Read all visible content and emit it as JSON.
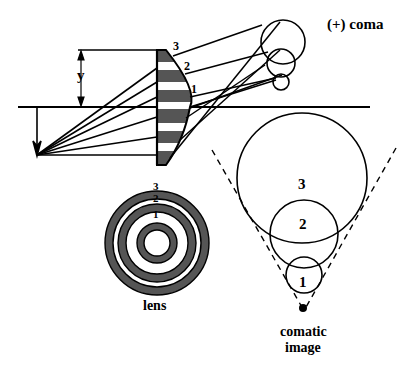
{
  "title": "(+) coma",
  "labels": {
    "height": "y",
    "zone1": "1",
    "zone2": "2",
    "zone3": "3",
    "lens": "lens",
    "comatic_line1": "comatic",
    "comatic_line2": "image"
  },
  "rings": {
    "lens_zones": [
      "1",
      "2",
      "3"
    ],
    "image_circles": [
      "1",
      "2",
      "3"
    ]
  },
  "colors": {
    "ink": "#000000",
    "lens_fill": "#555555",
    "background": "#ffffff"
  }
}
